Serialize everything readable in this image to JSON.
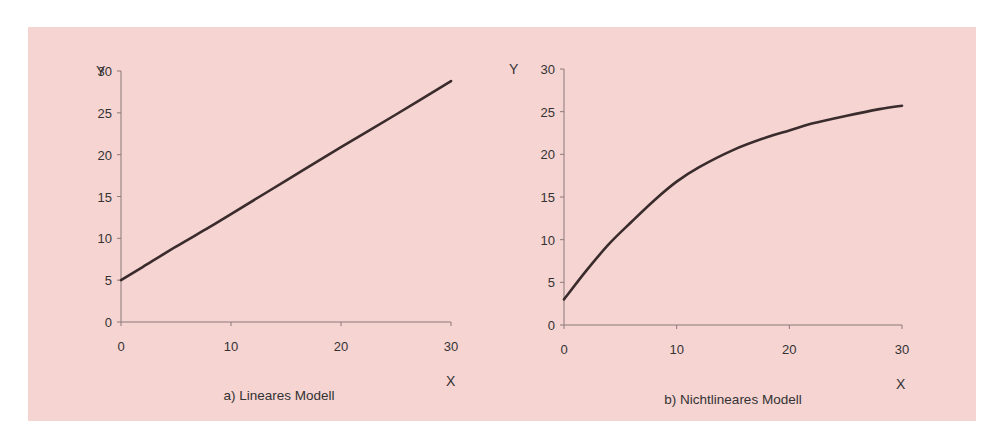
{
  "figure": {
    "background_color": "#f6d4d2",
    "line_color": "#3a2c2c",
    "axis_color": "#8a7a7a"
  },
  "chart_data": [
    {
      "type": "line",
      "title": "a) Lineares Modell",
      "xlabel": "X",
      "ylabel": "Y",
      "xlim": [
        0,
        30
      ],
      "ylim": [
        0,
        30
      ],
      "x_ticks": [
        "0",
        "10",
        "20",
        "30"
      ],
      "y_ticks": [
        "0",
        "5",
        "10",
        "15",
        "20",
        "25",
        "30"
      ],
      "grid": false,
      "legend": null,
      "x": [
        0,
        2,
        5,
        8,
        10,
        15,
        20,
        25,
        30
      ],
      "series": [
        {
          "name": "Lineares Modell",
          "values": [
            5.0,
            6.6,
            9.0,
            11.3,
            12.9,
            16.9,
            20.9,
            24.8,
            28.8
          ]
        }
      ]
    },
    {
      "type": "line",
      "title": "b) Nichtlineares Modell",
      "xlabel": "X",
      "ylabel": "Y",
      "xlim": [
        0,
        30
      ],
      "ylim": [
        0,
        30
      ],
      "x_ticks": [
        "0",
        "10",
        "20",
        "30"
      ],
      "y_ticks": [
        "0",
        "5",
        "10",
        "15",
        "20",
        "25",
        "30"
      ],
      "grid": false,
      "legend": null,
      "x": [
        0,
        2,
        4,
        6,
        8,
        10,
        12,
        15,
        18,
        20,
        22,
        25,
        28,
        30
      ],
      "series": [
        {
          "name": "Nichtlineares Modell",
          "values": [
            3.0,
            6.4,
            9.5,
            12.1,
            14.6,
            16.8,
            18.5,
            20.5,
            22.0,
            22.8,
            23.6,
            24.5,
            25.3,
            25.7
          ]
        }
      ]
    }
  ]
}
